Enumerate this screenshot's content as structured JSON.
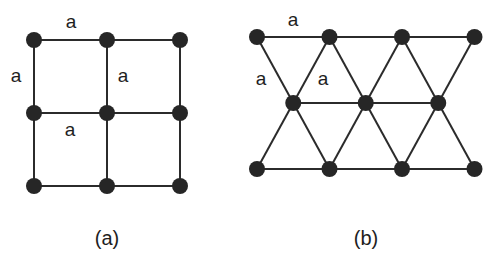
{
  "figure": {
    "panels": [
      {
        "id": "a",
        "caption": "(a)",
        "lattice": "square",
        "rows": 3,
        "cols": 3,
        "edge_labels": [
          "a",
          "a",
          "a",
          "a"
        ]
      },
      {
        "id": "b",
        "caption": "(b)",
        "lattice": "triangular",
        "row_counts": [
          4,
          3,
          4
        ],
        "edge_labels": [
          "a",
          "a",
          "a"
        ]
      }
    ],
    "colors": {
      "node": "#262626",
      "edge": "#2b2b2b",
      "background": "#ffffff"
    }
  }
}
